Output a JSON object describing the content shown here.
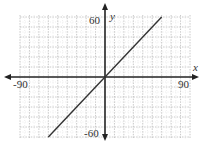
{
  "chart_data": {
    "type": "line",
    "title": "",
    "xlabel": "x",
    "ylabel": "y",
    "xlim": [
      -90,
      90
    ],
    "ylim": [
      -60,
      60
    ],
    "x_tick_labels": [
      "-90",
      "90"
    ],
    "y_tick_labels": [
      "60",
      "-60"
    ],
    "grid": true,
    "grid_major_step": {
      "x": 10,
      "y": 10
    },
    "legend": null,
    "series": [
      {
        "name": "y = x",
        "x": [
          -60,
          60
        ],
        "y": [
          -60,
          60
        ]
      }
    ]
  },
  "labels": {
    "x_axis": "x",
    "y_axis": "y",
    "x_min": "-90",
    "x_max": "90",
    "y_max": "60",
    "y_min": "-60"
  },
  "colors": {
    "axis": "#222222",
    "line": "#333333",
    "grid": "#bbbbbb",
    "label": "#333333"
  }
}
